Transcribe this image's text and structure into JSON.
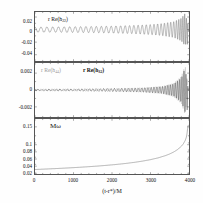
{
  "figure": {
    "xaxis": {
      "title": "(t-r*)/M",
      "ticks": [
        "0",
        "1000",
        "2000",
        "3000",
        "4000"
      ],
      "min": 0,
      "max": 4000
    }
  },
  "chart_data": [
    {
      "type": "line",
      "panel": "top",
      "title": "",
      "annotation": "r Re(h22)",
      "annotation_parts": {
        "pre": "r Re(h",
        "sub": "22",
        "post": ")"
      },
      "xlabel": "(t-r*)/M",
      "ylabel": "",
      "xlim": [
        0,
        4000
      ],
      "ylim": [
        -0.05,
        0.028
      ],
      "yticks": [
        "0.02",
        "0",
        "-0.02",
        "-0.04"
      ],
      "ytickvals": [
        0.02,
        0,
        -0.02,
        -0.04
      ],
      "grid": false,
      "legend": "none",
      "series": [
        {
          "name": "r Re(h22)",
          "color": "#555555",
          "description": "inspiral chirp: sinusoid with slowly growing amplitude and frequency, peaking near t=3900 then ringdown",
          "envelope_x": [
            0,
            500,
            1000,
            1500,
            2000,
            2500,
            3000,
            3300,
            3600,
            3800,
            3900,
            3950,
            4000
          ],
          "envelope_y": [
            0.004,
            0.0042,
            0.0045,
            0.0049,
            0.0055,
            0.0064,
            0.0079,
            0.0095,
            0.0125,
            0.018,
            0.026,
            0.014,
            0.003
          ],
          "frequency_x": [
            0,
            1000,
            2000,
            3000,
            3600,
            3900,
            4000
          ],
          "frequency_y": [
            0.04,
            0.044,
            0.05,
            0.062,
            0.082,
            0.14,
            0.16
          ]
        }
      ]
    },
    {
      "type": "line",
      "panel": "middle",
      "title": "",
      "annotations": [
        {
          "text": "r Re(h44)",
          "color": "#9a9a9a",
          "pre": "r Re(h",
          "sub": "44",
          "post": ")"
        },
        {
          "text": "r Re(h32)",
          "color": "#111111",
          "pre": "r Re(h",
          "sub": "32",
          "post": ")"
        }
      ],
      "xlabel": "(t-r*)/M",
      "ylabel": "",
      "xlim": [
        0,
        4000
      ],
      "ylim": [
        -0.0032,
        0.0032
      ],
      "yticks": [
        "0.002",
        "0",
        "-0.002"
      ],
      "ytickvals": [
        0.002,
        0,
        -0.002
      ],
      "grid": false,
      "legend": "inline",
      "series": [
        {
          "name": "r Re(h44)",
          "color": "#9a9a9a",
          "description": "very small amplitude high-frequency oscillation growing sharply only near merger",
          "envelope_x": [
            0,
            1000,
            2000,
            2800,
            3300,
            3600,
            3800,
            3900,
            3950,
            4000
          ],
          "envelope_y": [
            0.00012,
            0.00014,
            0.00019,
            0.00028,
            0.00045,
            0.0008,
            0.0016,
            0.0029,
            0.0012,
            0.0002
          ]
        },
        {
          "name": "r Re(h32)",
          "color": "#111111",
          "description": "small amplitude oscillation growing sharply only near merger",
          "envelope_x": [
            0,
            1000,
            2000,
            2800,
            3300,
            3600,
            3800,
            3900,
            3950,
            4000
          ],
          "envelope_y": [
            0.0001,
            0.00012,
            0.00016,
            0.00024,
            0.0004,
            0.0007,
            0.0014,
            0.0026,
            0.001,
            0.00018
          ]
        }
      ]
    },
    {
      "type": "line",
      "panel": "bottom",
      "title": "",
      "annotation": "Mω",
      "xlabel": "(t-r*)/M",
      "ylabel": "",
      "xlim": [
        0,
        4000
      ],
      "ylim": [
        0.018,
        0.172
      ],
      "yticks": [
        "0.15",
        "0.1",
        "0.08",
        "0.06",
        "0.04",
        "0.02"
      ],
      "ytickvals": [
        0.15,
        0.1,
        0.08,
        0.06,
        0.04,
        0.02
      ],
      "grid": false,
      "legend": "none",
      "series": [
        {
          "name": "Mω",
          "color": "#555555",
          "description": "orbital angular frequency rising monotonically, diverging near merger at t~3950",
          "x": [
            0,
            200,
            400,
            600,
            800,
            1000,
            1200,
            1400,
            1600,
            1800,
            2000,
            2200,
            2400,
            2600,
            2800,
            3000,
            3200,
            3400,
            3500,
            3600,
            3700,
            3800,
            3850,
            3900,
            3930,
            3950,
            3960,
            3975,
            4000
          ],
          "y": [
            0.0305,
            0.0315,
            0.0325,
            0.0335,
            0.0346,
            0.0358,
            0.0371,
            0.0385,
            0.04,
            0.0417,
            0.0436,
            0.0457,
            0.0481,
            0.0509,
            0.0542,
            0.0582,
            0.0632,
            0.0699,
            0.0742,
            0.0795,
            0.0862,
            0.0955,
            0.102,
            0.1115,
            0.1205,
            0.132,
            0.142,
            0.153,
            0.156
          ]
        }
      ]
    }
  ]
}
